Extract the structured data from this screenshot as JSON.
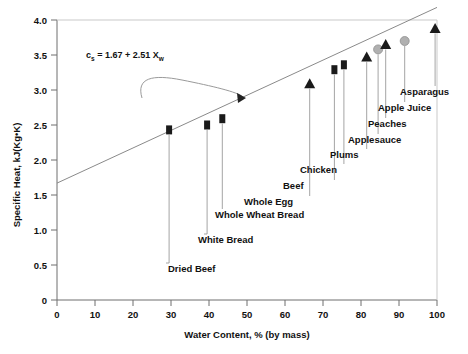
{
  "chart_data": {
    "type": "scatter",
    "title": "",
    "xlabel": "Water Content, % (by mass)",
    "ylabel": "Specific Heat, kJ(Kg•K)",
    "xlim": [
      0,
      100
    ],
    "ylim": [
      0,
      4.0
    ],
    "xticks": [
      "0",
      "10",
      "20",
      "30",
      "40",
      "50",
      "60",
      "70",
      "80",
      "90",
      "100"
    ],
    "yticks": [
      "0",
      "0.5",
      "1.0",
      "1.5",
      "2.0",
      "2.5",
      "3.0",
      "3.5",
      "4.0"
    ],
    "grid": false,
    "legend": "none",
    "annotation": {
      "equation_prefix": "c",
      "equation_sub1": "s",
      "equation_mid": " = 1.67 + 2.51 X",
      "equation_sub2": "w",
      "equation_full": "c_s = 1.67 + 2.51 X_w",
      "slope": 2.51,
      "intercept": 1.67,
      "arrow": "curved-arrow-to-trendline"
    },
    "trendline": {
      "name": "linear fit",
      "from": [
        0,
        1.67
      ],
      "to": [
        100,
        4.18
      ],
      "color": "#8a8a8a"
    },
    "points": [
      {
        "label": "Dried Beef",
        "x": 29.5,
        "y": 2.43,
        "marker": "square",
        "color": "#1a1a1a"
      },
      {
        "label": "White Bread",
        "x": 39.5,
        "y": 2.5,
        "marker": "square",
        "color": "#1a1a1a"
      },
      {
        "label": "Whole Wheat Bread",
        "x": 43.5,
        "y": 2.59,
        "marker": "square",
        "color": "#1a1a1a"
      },
      {
        "label": "Whole Egg",
        "x": 66.5,
        "y": 3.09,
        "marker": "triangle",
        "color": "#1a1a1a"
      },
      {
        "label": "Beef",
        "x": 73.0,
        "y": 3.29,
        "marker": "square",
        "color": "#1a1a1a"
      },
      {
        "label": "Chicken",
        "x": 75.5,
        "y": 3.36,
        "marker": "square",
        "color": "#1a1a1a"
      },
      {
        "label": "Plums",
        "x": 81.5,
        "y": 3.47,
        "marker": "triangle",
        "color": "#1a1a1a"
      },
      {
        "label": "Applesauce",
        "x": 84.5,
        "y": 3.58,
        "marker": "circle",
        "color": "#b0b0b0"
      },
      {
        "label": "Peaches",
        "x": 86.5,
        "y": 3.65,
        "marker": "triangle",
        "color": "#1a1a1a"
      },
      {
        "label": "Apple Juice",
        "x": 91.5,
        "y": 3.7,
        "marker": "circle",
        "color": "#b0b0b0"
      },
      {
        "label": "Asparagus",
        "x": 99.5,
        "y": 3.88,
        "marker": "triangle",
        "color": "#1a1a1a"
      }
    ],
    "labels_layout": [
      {
        "label": "Dried Beef",
        "tx": 168,
        "ty": 272,
        "anchor": "start",
        "leader_from_x": 166,
        "leader_to_y": 263
      },
      {
        "label": "White Bread",
        "tx": 198,
        "ty": 243,
        "anchor": "start",
        "leader_from_x": 204,
        "leader_to_y": 234
      },
      {
        "label": "Whole Wheat Bread",
        "tx": 215,
        "ty": 218,
        "anchor": "start",
        "leader_from_x": 221,
        "leader_to_y": 209
      },
      {
        "label": "Whole Egg",
        "tx": 244,
        "ty": 205,
        "anchor": "start",
        "leader_from_x": 308,
        "leader_to_y": 196
      },
      {
        "label": "Beef",
        "tx": 283,
        "ty": 189,
        "anchor": "start",
        "leader_from_x": 333,
        "leader_to_y": 180
      },
      {
        "label": "Chicken",
        "tx": 300,
        "ty": 173,
        "anchor": "start",
        "leader_from_x": 343,
        "leader_to_y": 164
      },
      {
        "label": "Plums",
        "tx": 330,
        "ty": 158,
        "anchor": "start",
        "leader_from_x": 366,
        "leader_to_y": 149
      },
      {
        "label": "Applesauce",
        "tx": 348,
        "ty": 143,
        "anchor": "start",
        "leader_from_x": 378,
        "leader_to_y": 134
      },
      {
        "label": "Peaches",
        "tx": 368,
        "ty": 127,
        "anchor": "start",
        "leader_from_x": 386,
        "leader_to_y": 118
      },
      {
        "label": "Apple Juice",
        "tx": 378,
        "ty": 111,
        "anchor": "start",
        "leader_from_x": 405,
        "leader_to_y": 102
      },
      {
        "label": "Asparagus",
        "tx": 400,
        "ty": 95,
        "anchor": "start",
        "leader_from_x": 435,
        "leader_to_y": 86
      }
    ]
  }
}
